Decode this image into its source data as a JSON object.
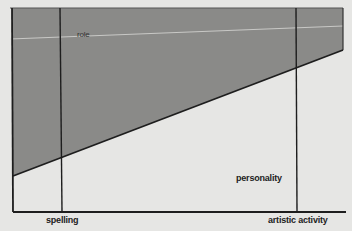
{
  "diagram": {
    "labels": {
      "role": "role",
      "personality": "personality",
      "x_left": "spelling",
      "x_right": "artistic activity"
    },
    "colors": {
      "background": "#e6e6e4",
      "shaded_region": "#8a8a88",
      "lines": "#1e1e1e",
      "role_line": "#d8d8d6"
    }
  }
}
